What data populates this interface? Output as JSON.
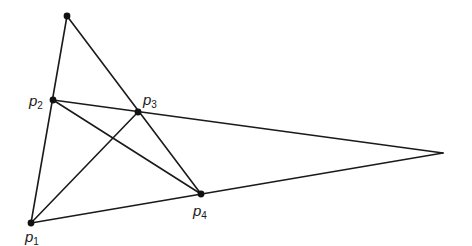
{
  "diagram": {
    "stroke_color": "#1a1a1a",
    "background": "#ffffff",
    "points": {
      "top": {
        "x": 67,
        "y": 16,
        "dot": true,
        "label": ""
      },
      "p1": {
        "x": 31,
        "y": 223,
        "dot": true,
        "label": "p",
        "sub": "1"
      },
      "p2": {
        "x": 53,
        "y": 100,
        "dot": true,
        "label": "p",
        "sub": "2"
      },
      "p3": {
        "x": 138,
        "y": 112,
        "dot": true,
        "label": "p",
        "sub": "3"
      },
      "p4": {
        "x": 201,
        "y": 194,
        "dot": true,
        "label": "p",
        "sub": "4"
      },
      "right": {
        "x": 443,
        "y": 153,
        "dot": false,
        "label": ""
      }
    },
    "edges": [
      [
        "top",
        "p1"
      ],
      [
        "top",
        "p4"
      ],
      [
        "p2",
        "right"
      ],
      [
        "p1",
        "right"
      ],
      [
        "p1",
        "p3"
      ],
      [
        "p2",
        "p4"
      ]
    ],
    "labels": [
      {
        "id": "p1",
        "text": "p",
        "sub": "1",
        "x": 25,
        "y": 229
      },
      {
        "id": "p2",
        "text": "p",
        "sub": "2",
        "x": 29,
        "y": 93
      },
      {
        "id": "p3",
        "text": "p",
        "sub": "3",
        "x": 143,
        "y": 92
      },
      {
        "id": "p4",
        "text": "p",
        "sub": "4",
        "x": 193,
        "y": 203
      }
    ]
  }
}
